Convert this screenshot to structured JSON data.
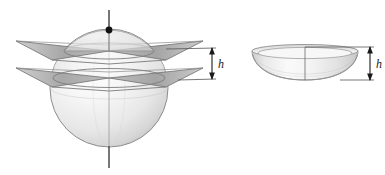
{
  "figure": {
    "caption": "",
    "background_color": "#ffffff",
    "panels": [
      {
        "id": "sphere-with-planes",
        "name": "sphere-cut-by-two-parallel-planes",
        "description": "Sphere intersected by two horizontal parallel planes, with vertical axis through poles and a marked top pole point",
        "dimension_label": "h"
      },
      {
        "id": "spherical-zone",
        "name": "isolated-spherical-zone",
        "description": "The spherical zone (band) of height h removed from the sphere, shown separately",
        "dimension_label": "h"
      }
    ]
  },
  "labels": {
    "height_left": "h",
    "height_right": "h"
  },
  "colors": {
    "sphere_fill_light": "#f4f4f4",
    "sphere_fill_mid": "#e2e2e2",
    "sphere_fill_dark": "#c9c9c9",
    "sphere_outline": "#8d8d8d",
    "plane_fill": "#b0b0b0",
    "plane_outline": "#6f6f6f",
    "axis_line": "#4a4a4a",
    "pole_dot": "#111111",
    "dimension_line": "#1a1a1a",
    "leader_line": "#555555",
    "zone_fill_light": "#fbfbfb",
    "zone_fill_mid": "#eaeaea",
    "zone_outline": "#9a9a9a",
    "label_text": "#1a1a1a"
  },
  "geometry": {
    "sphere": {
      "center_x": 109,
      "center_y": 88,
      "radius": 59
    },
    "axis": {
      "x": 109,
      "top_y": 10,
      "bottom_y": 168
    },
    "pole_dot": {
      "cx": 109,
      "cy": 30,
      "r": 3.4
    },
    "upper_plane_y": 51,
    "lower_plane_y": 78,
    "left_dimension": {
      "x": 212,
      "top_y": 48,
      "bottom_y": 79,
      "label_x": 219,
      "label_y": 68
    },
    "right_dimension": {
      "x": 370,
      "top_y": 47,
      "bottom_y": 80,
      "label_x": 377,
      "label_y": 68
    },
    "zone": {
      "center_x": 305,
      "top_y": 47,
      "bottom_y": 80
    }
  }
}
